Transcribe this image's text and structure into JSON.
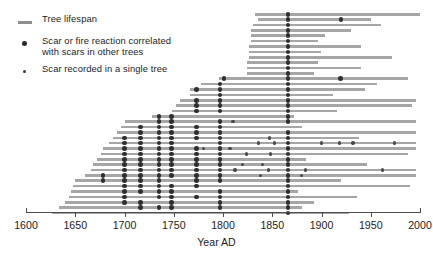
{
  "chart_data": {
    "type": "timeline",
    "title": "",
    "xlabel": "Year AD",
    "ylabel": "",
    "xlim": [
      1600,
      2000
    ],
    "xticks": [
      1600,
      1650,
      1700,
      1750,
      1800,
      1850,
      1900,
      1950,
      2000
    ],
    "grid": false,
    "legend_position": "top-left",
    "legend": [
      {
        "key": "tree-lifespan",
        "symbol": "line",
        "label": "Tree lifespan",
        "color": "#8e8e8e"
      },
      {
        "key": "scar-correlated",
        "symbol": "dot-large",
        "label": "Scar or fire reaction correlated\nwith scars in other trees",
        "color": "#2e2e2e"
      },
      {
        "key": "scar-single",
        "symbol": "dot-small",
        "label": "Scar recorded in a single tree",
        "color": "#4a4a4a"
      }
    ],
    "series_name": "Tree lifespan records with fire scars",
    "n_trees": 38,
    "trees": [
      {
        "start": 1832,
        "end": 2000,
        "scars_correlated": [
          1866
        ],
        "scars_single": []
      },
      {
        "start": 1836,
        "end": 1950,
        "scars_correlated": [
          1866,
          1920
        ],
        "scars_single": []
      },
      {
        "start": 1830,
        "end": 1960,
        "scars_correlated": [
          1866
        ],
        "scars_single": []
      },
      {
        "start": 1828,
        "end": 1930,
        "scars_correlated": [
          1866
        ],
        "scars_single": []
      },
      {
        "start": 1828,
        "end": 1904,
        "scars_correlated": [
          1866
        ],
        "scars_single": []
      },
      {
        "start": 1828,
        "end": 1896,
        "scars_correlated": [
          1866
        ],
        "scars_single": []
      },
      {
        "start": 1826,
        "end": 1940,
        "scars_correlated": [
          1866
        ],
        "scars_single": []
      },
      {
        "start": 1826,
        "end": 1900,
        "scars_correlated": [
          1866
        ],
        "scars_single": []
      },
      {
        "start": 1826,
        "end": 1972,
        "scars_correlated": [
          1866
        ],
        "scars_single": []
      },
      {
        "start": 1824,
        "end": 1896,
        "scars_correlated": [
          1866
        ],
        "scars_single": []
      },
      {
        "start": 1824,
        "end": 1940,
        "scars_correlated": [
          1866
        ],
        "scars_single": []
      },
      {
        "start": 1824,
        "end": 1892,
        "scars_correlated": [
          1866
        ],
        "scars_single": []
      },
      {
        "start": 1796,
        "end": 1988,
        "scars_correlated": [
          1801,
          1866,
          1919
        ],
        "scars_single": []
      },
      {
        "start": 1778,
        "end": 1956,
        "scars_correlated": [
          1797,
          1866
        ],
        "scars_single": []
      },
      {
        "start": 1766,
        "end": 1944,
        "scars_correlated": [
          1773,
          1797,
          1866
        ],
        "scars_single": []
      },
      {
        "start": 1766,
        "end": 1912,
        "scars_correlated": [
          1797,
          1866
        ],
        "scars_single": []
      },
      {
        "start": 1756,
        "end": 1996,
        "scars_correlated": [
          1773,
          1797,
          1866
        ],
        "scars_single": []
      },
      {
        "start": 1752,
        "end": 1992,
        "scars_correlated": [
          1773,
          1797,
          1866
        ],
        "scars_single": []
      },
      {
        "start": 1748,
        "end": 1916,
        "scars_correlated": [
          1773,
          1797,
          1866
        ],
        "scars_single": []
      },
      {
        "start": 1728,
        "end": 1872,
        "scars_correlated": [
          1735,
          1748,
          1866
        ],
        "scars_single": []
      },
      {
        "start": 1700,
        "end": 1996,
        "scars_correlated": [
          1735,
          1748,
          1797,
          1866
        ],
        "scars_single": [
          1810
        ]
      },
      {
        "start": 1696,
        "end": 1880,
        "scars_correlated": [
          1716,
          1735,
          1748,
          1773,
          1797
        ],
        "scars_single": []
      },
      {
        "start": 1692,
        "end": 1996,
        "scars_correlated": [
          1716,
          1735,
          1748,
          1773,
          1797,
          1866
        ],
        "scars_single": []
      },
      {
        "start": 1688,
        "end": 1938,
        "scars_correlated": [
          1700,
          1716,
          1735,
          1748,
          1773,
          1797,
          1866
        ],
        "scars_single": [
          1847
        ]
      },
      {
        "start": 1684,
        "end": 1996,
        "scars_correlated": [
          1700,
          1716,
          1735,
          1748,
          1797,
          1866
        ],
        "scars_single": [
          1836,
          1852,
          1900,
          1918,
          1932,
          1974
        ]
      },
      {
        "start": 1678,
        "end": 1996,
        "scars_correlated": [
          1700,
          1716,
          1735,
          1748,
          1773,
          1797,
          1866
        ],
        "scars_single": [
          1780,
          1807
        ]
      },
      {
        "start": 1676,
        "end": 1988,
        "scars_correlated": [
          1700,
          1716,
          1735,
          1748,
          1773,
          1797,
          1866
        ],
        "scars_single": [
          1824,
          1848
        ]
      },
      {
        "start": 1672,
        "end": 1884,
        "scars_correlated": [
          1700,
          1716,
          1735,
          1748,
          1773,
          1797,
          1866
        ],
        "scars_single": []
      },
      {
        "start": 1668,
        "end": 1946,
        "scars_correlated": [
          1700,
          1716,
          1735,
          1748,
          1773,
          1797,
          1866
        ],
        "scars_single": [
          1820,
          1840
        ]
      },
      {
        "start": 1666,
        "end": 1996,
        "scars_correlated": [
          1700,
          1716,
          1735,
          1748,
          1773,
          1797,
          1866
        ],
        "scars_single": [
          1812,
          1846,
          1884,
          1962
        ]
      },
      {
        "start": 1660,
        "end": 1996,
        "scars_correlated": [
          1678,
          1700,
          1716,
          1735,
          1748,
          1773,
          1797,
          1866
        ],
        "scars_single": [
          1838,
          1880
        ]
      },
      {
        "start": 1650,
        "end": 1920,
        "scars_correlated": [
          1678,
          1700,
          1716,
          1735,
          1773,
          1797,
          1866
        ],
        "scars_single": []
      },
      {
        "start": 1648,
        "end": 1990,
        "scars_correlated": [
          1700,
          1716,
          1735,
          1748,
          1773,
          1866
        ],
        "scars_single": []
      },
      {
        "start": 1646,
        "end": 1876,
        "scars_correlated": [
          1700,
          1716,
          1735,
          1748,
          1797,
          1866
        ],
        "scars_single": []
      },
      {
        "start": 1644,
        "end": 1936,
        "scars_correlated": [
          1700,
          1735,
          1748,
          1773,
          1797,
          1866
        ],
        "scars_single": []
      },
      {
        "start": 1640,
        "end": 1892,
        "scars_correlated": [
          1700,
          1716,
          1748,
          1797,
          1866
        ],
        "scars_single": []
      },
      {
        "start": 1634,
        "end": 1880,
        "scars_correlated": [
          1716,
          1735,
          1748,
          1797,
          1866
        ],
        "scars_single": []
      },
      {
        "start": 1626,
        "end": 1928,
        "scars_correlated": [
          1866
        ],
        "scars_single": []
      }
    ]
  }
}
